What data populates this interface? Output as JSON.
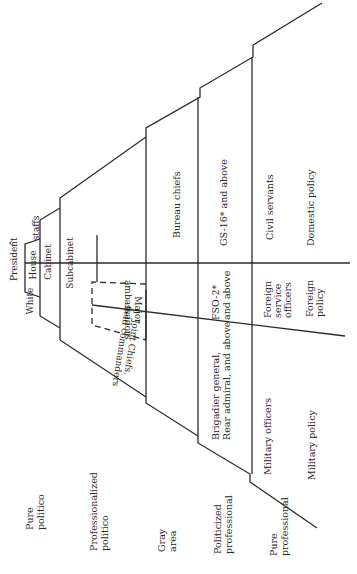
{
  "diagram": {
    "orientation": "rotated 90 degrees counterclockwise; apex at left",
    "apex": {
      "arrow": "^",
      "president": "President",
      "white_house_staffs": [
        "White",
        "House",
        "staffs"
      ],
      "cabinet": "Cabinet",
      "subcabinet": "Subcabinet"
    },
    "tier_labels": [
      {
        "lines": [
          "Pure",
          "politico"
        ]
      },
      {
        "lines": [
          "Professionalized",
          "politico"
        ]
      },
      {
        "lines": [
          "Gray",
          "area"
        ]
      },
      {
        "lines": [
          "Politicized",
          "professional"
        ]
      },
      {
        "lines": [
          "Pure",
          "professional"
        ]
      }
    ],
    "military": {
      "joint_chiefs": [
        "Joint Chiefs,",
        "field commanders"
      ],
      "rank": [
        "Brigadier general,",
        "Rear admiral, and above"
      ],
      "officers": "Military officers",
      "policy": "Military policy"
    },
    "foreign": {
      "ambassadors": [
        "Major",
        "ambassadors"
      ],
      "rank": [
        "FSO-2*",
        "and above"
      ],
      "officers": [
        "Foreign",
        "service",
        "officers"
      ],
      "policy": [
        "Foreign",
        "policy"
      ]
    },
    "domestic": {
      "bureau": "Bureau chiefs",
      "rank": "GS-16* and above",
      "officers": "Civil servants",
      "policy": "Domestic policy"
    }
  }
}
